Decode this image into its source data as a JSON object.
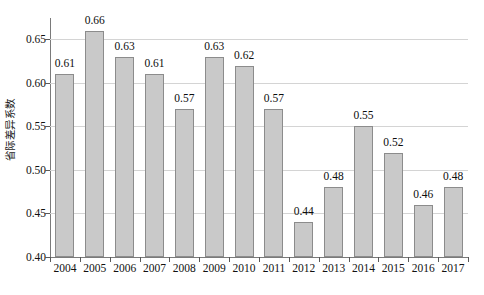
{
  "chart_data": {
    "type": "bar",
    "title": "",
    "subtitle": "",
    "xlabel": "",
    "ylabel": "省际差异系数",
    "categories": [
      "2004",
      "2005",
      "2006",
      "2007",
      "2008",
      "2009",
      "2010",
      "2011",
      "2012",
      "2013",
      "2014",
      "2015",
      "2016",
      "2017"
    ],
    "values": [
      0.61,
      0.66,
      0.63,
      0.61,
      0.57,
      0.63,
      0.62,
      0.57,
      0.44,
      0.48,
      0.55,
      0.52,
      0.46,
      0.48
    ],
    "data_labels": [
      "0.61",
      "0.66",
      "0.63",
      "0.61",
      "0.57",
      "0.63",
      "0.62",
      "0.57",
      "0.44",
      "0.48",
      "0.55",
      "0.52",
      "0.46",
      "0.48"
    ],
    "ylim": [
      0.4,
      0.67
    ],
    "ytick_values": [
      0.4,
      0.45,
      0.5,
      0.55,
      0.6,
      0.65
    ],
    "ytick_labels": [
      "0.40",
      "0.45",
      "0.50",
      "0.55",
      "0.60",
      "0.65"
    ],
    "grid": true,
    "grid_axis": "y",
    "legend": false,
    "legend_position": "none",
    "bar_fill_color": "#c9c9c9",
    "bar_border_color": "#8c8c8c",
    "gridline_color": "#d4d4d4",
    "axis_color": "#7a7a7a",
    "background_color": "#ffffff"
  }
}
